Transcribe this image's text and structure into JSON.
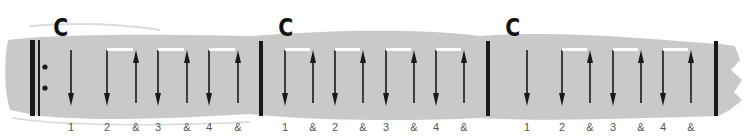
{
  "colors": {
    "band": "#c9c9c9",
    "ink": "#1a1a1a",
    "count_text": "#555555",
    "beam": "#ffffff"
  },
  "measures": [
    {
      "chord": "C",
      "chord_x": 52,
      "start_barline": "repeat-start",
      "end_barline": "single",
      "strums": [
        {
          "dir": "down",
          "x": 71,
          "count": "1"
        },
        {
          "dir": "down",
          "x": 107,
          "count": "2",
          "beam_to_next": true
        },
        {
          "dir": "up",
          "x": 136,
          "count": "&"
        },
        {
          "dir": "down",
          "x": 158,
          "count": "3",
          "beam_to_next": true
        },
        {
          "dir": "up",
          "x": 187,
          "count": "&"
        },
        {
          "dir": "down",
          "x": 209,
          "count": "4",
          "beam_to_next": true
        },
        {
          "dir": "up",
          "x": 238,
          "count": "&"
        }
      ]
    },
    {
      "chord": "C",
      "chord_x": 277,
      "start_barline": "single",
      "end_barline": "single",
      "strums": [
        {
          "dir": "down",
          "x": 285,
          "count": "1",
          "beam_to_next": true
        },
        {
          "dir": "up",
          "x": 313,
          "count": "&"
        },
        {
          "dir": "down",
          "x": 335,
          "count": "2",
          "beam_to_next": true
        },
        {
          "dir": "up",
          "x": 363,
          "count": "&"
        },
        {
          "dir": "down",
          "x": 386,
          "count": "3",
          "beam_to_next": true
        },
        {
          "dir": "up",
          "x": 414,
          "count": "&"
        },
        {
          "dir": "down",
          "x": 436,
          "count": "4",
          "beam_to_next": true
        },
        {
          "dir": "up",
          "x": 464,
          "count": "&"
        }
      ]
    },
    {
      "chord": "C",
      "chord_x": 504,
      "start_barline": "single",
      "end_barline": "single",
      "strums": [
        {
          "dir": "down",
          "x": 527,
          "count": "1"
        },
        {
          "dir": "down",
          "x": 562,
          "count": "2",
          "beam_to_next": true
        },
        {
          "dir": "up",
          "x": 590,
          "count": "&"
        },
        {
          "dir": "down",
          "x": 613,
          "count": "3",
          "beam_to_next": true
        },
        {
          "dir": "up",
          "x": 641,
          "count": "&"
        },
        {
          "dir": "down",
          "x": 663,
          "count": "4",
          "beam_to_next": true
        },
        {
          "dir": "up",
          "x": 691,
          "count": "&"
        }
      ]
    }
  ],
  "barlines": {
    "repeat_thick_x": 32,
    "repeat_thin_x": 39,
    "repeat_dots_x": 45,
    "bar1_x": 261,
    "bar2_x": 488,
    "final_x": 716
  }
}
